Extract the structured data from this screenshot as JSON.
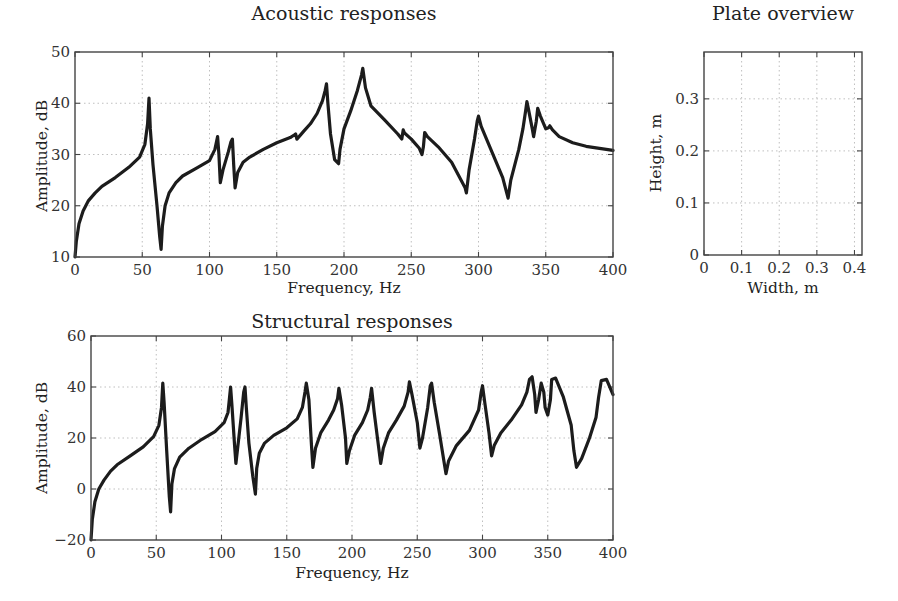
{
  "chart_data": [
    {
      "id": "acoustic",
      "type": "line",
      "title": "Acoustic responses",
      "xlabel": "Frequency, Hz",
      "ylabel": "Amplitude, dB",
      "xlim": [
        0,
        400
      ],
      "ylim": [
        10,
        50
      ],
      "xticks": [
        0,
        50,
        100,
        150,
        200,
        250,
        300,
        350,
        400
      ],
      "yticks": [
        10,
        20,
        30,
        40,
        50
      ],
      "grid": true,
      "legend": null,
      "series": [
        {
          "name": "Acoustic response",
          "x": [
            0,
            1,
            3,
            6,
            10,
            15,
            20,
            30,
            40,
            48,
            52,
            54,
            55,
            56,
            58,
            61,
            63,
            64,
            65,
            67,
            70,
            75,
            80,
            90,
            100,
            104,
            106,
            107,
            108,
            110,
            114,
            116,
            117,
            118,
            119,
            121,
            125,
            130,
            140,
            150,
            160,
            163,
            164,
            165,
            170,
            175,
            180,
            184,
            186,
            187,
            188,
            190,
            193,
            196,
            197,
            200,
            205,
            210,
            213,
            214,
            216,
            220,
            230,
            240,
            243,
            244,
            245,
            250,
            256,
            258,
            259,
            260,
            262,
            270,
            280,
            287,
            290,
            291,
            293,
            297,
            299,
            300,
            302,
            310,
            318,
            321,
            322,
            324,
            330,
            333,
            335,
            336,
            337,
            340,
            341,
            343,
            344,
            346,
            350,
            352,
            353,
            355,
            360,
            370,
            380,
            390,
            400
          ],
          "y": [
            10,
            13,
            16.5,
            19,
            21,
            22.5,
            23.8,
            25.5,
            27.5,
            29.5,
            32,
            36,
            41,
            35,
            28,
            20,
            14,
            11.5,
            16,
            20,
            22.5,
            24.5,
            25.8,
            27.3,
            28.8,
            31,
            33.5,
            30,
            24.5,
            27,
            30.5,
            32.5,
            33,
            28,
            23.5,
            26.5,
            28.5,
            29.5,
            31,
            32.3,
            33.3,
            33.8,
            34,
            33,
            34.5,
            36,
            38,
            40.5,
            42.5,
            43.8,
            40,
            34,
            29,
            28.2,
            31,
            35,
            38.5,
            42.5,
            45.5,
            46.8,
            43,
            39.5,
            36.8,
            34,
            33,
            34.8,
            34.2,
            33,
            31.2,
            30,
            31.5,
            34.3,
            33.5,
            31.5,
            28.5,
            25,
            23.5,
            22.5,
            27,
            33,
            36.5,
            37.5,
            35.5,
            30.5,
            25.5,
            22.5,
            21.5,
            25,
            31,
            35,
            38.5,
            40.3,
            39,
            35,
            33.5,
            36.5,
            39,
            37.5,
            35,
            35.2,
            35.6,
            34.8,
            33.5,
            32.3,
            31.6,
            31.2,
            30.8
          ]
        }
      ]
    },
    {
      "id": "plate",
      "type": "scatter",
      "title": "Plate overview",
      "xlabel": "Width, m",
      "ylabel": "Height, m",
      "xlim": [
        0,
        0.42
      ],
      "ylim": [
        0,
        0.39
      ],
      "xticks": [
        "0",
        "0.1",
        "0.2",
        "0.3",
        "0.4"
      ],
      "yticks": [
        "0",
        "0.1",
        "0.2",
        "0.3"
      ],
      "grid": true,
      "series": []
    },
    {
      "id": "structural",
      "type": "line",
      "title": "Structural responses",
      "xlabel": "Frequency, Hz",
      "ylabel": "Amplitude, dB",
      "xlim": [
        0,
        400
      ],
      "ylim": [
        -20,
        60
      ],
      "xticks": [
        0,
        50,
        100,
        150,
        200,
        250,
        300,
        350,
        400
      ],
      "yticks": [
        -20,
        0,
        20,
        40,
        60
      ],
      "grid": true,
      "legend": null,
      "series": [
        {
          "name": "Structural response",
          "x": [
            0,
            1,
            3,
            6,
            10,
            15,
            20,
            30,
            40,
            48,
            52,
            54,
            55,
            56,
            58,
            60,
            61,
            62,
            64,
            68,
            75,
            85,
            95,
            102,
            105,
            106,
            107,
            108,
            110,
            111,
            113,
            115,
            117,
            118,
            119,
            121,
            124,
            126,
            127,
            129,
            133,
            140,
            150,
            158,
            162,
            164,
            165,
            167,
            169,
            170,
            172,
            176,
            182,
            186,
            189,
            190,
            192,
            195,
            196,
            198,
            202,
            208,
            212,
            214,
            215,
            217,
            220,
            222,
            224,
            228,
            234,
            240,
            243,
            244,
            246,
            250,
            252,
            254,
            258,
            260,
            261,
            263,
            267,
            271,
            272,
            274,
            280,
            290,
            297,
            299,
            300,
            302,
            305,
            307,
            309,
            314,
            322,
            330,
            334,
            336,
            338,
            340,
            341,
            343,
            345,
            347,
            348,
            350,
            352,
            353,
            356,
            362,
            368,
            370,
            372,
            376,
            382,
            387,
            389,
            391,
            395,
            400
          ],
          "y": [
            -20,
            -12,
            -5,
            0,
            3.5,
            7,
            9.5,
            13,
            16.5,
            20.5,
            25,
            32,
            41.5,
            34,
            15,
            -3,
            -9,
            2,
            8,
            12.5,
            16,
            19.5,
            22.5,
            26,
            30,
            35,
            40,
            33,
            17,
            10,
            19,
            28,
            38,
            40,
            32,
            18,
            5,
            -2,
            8,
            14,
            18,
            21,
            24,
            27.5,
            32,
            38,
            41.5,
            35,
            17,
            8.5,
            16,
            22,
            27,
            31,
            35.5,
            39.5,
            33,
            20,
            10,
            15,
            21,
            26,
            31,
            36,
            39.5,
            30,
            18,
            10,
            16,
            22,
            27,
            32.5,
            38,
            42,
            37,
            26,
            16,
            20,
            32,
            40.5,
            41.5,
            34,
            22,
            9,
            6,
            11,
            17,
            23,
            31,
            38,
            40.5,
            33,
            22,
            13,
            17,
            22,
            27,
            33,
            38,
            43,
            44,
            37,
            30,
            35,
            41.5,
            38,
            32,
            29,
            35,
            43,
            43.5,
            36,
            25,
            15,
            8.5,
            12,
            20,
            28,
            36,
            42.5,
            43,
            37,
            24,
            16
          ]
        }
      ]
    }
  ]
}
